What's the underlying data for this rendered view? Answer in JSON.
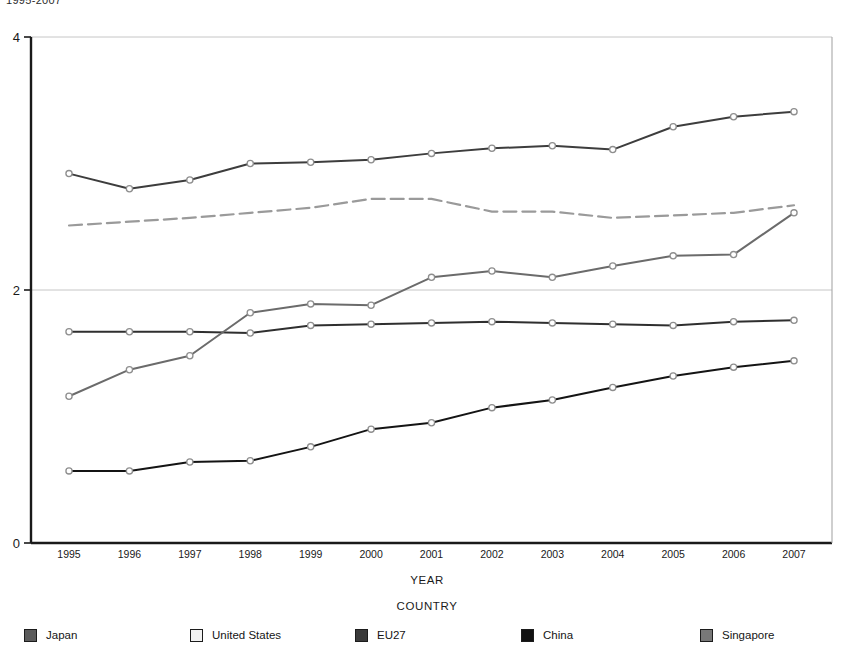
{
  "chart_title": "1995-2007",
  "axis_captions": {
    "x": "YEAR",
    "group": "COUNTRY"
  },
  "chart_data": {
    "type": "line",
    "title": "1995-2007",
    "xlabel": "YEAR",
    "ylabel": "",
    "legend_title": "COUNTRY",
    "legend_position": "bottom",
    "grid": true,
    "xlim": [
      1995,
      2007
    ],
    "ylim": [
      0,
      4
    ],
    "ytick_labels": [
      "0",
      "2",
      "4"
    ],
    "ytick_values": [
      0,
      2,
      4
    ],
    "categories": [
      "1995",
      "1996",
      "1997",
      "1998",
      "1999",
      "2000",
      "2001",
      "2002",
      "2003",
      "2004",
      "2005",
      "2006",
      "2007"
    ],
    "series": [
      {
        "name": "Japan",
        "color": "#3d3d3d",
        "style": "solid",
        "marker": "circle",
        "values": [
          2.92,
          2.8,
          2.87,
          3.0,
          3.01,
          3.03,
          3.08,
          3.12,
          3.14,
          3.11,
          3.29,
          3.37,
          3.41
        ]
      },
      {
        "name": "United States",
        "color": "#9a9a9a",
        "style": "dashed",
        "marker": "none",
        "values": [
          2.51,
          2.54,
          2.57,
          2.61,
          2.65,
          2.72,
          2.72,
          2.62,
          2.62,
          2.57,
          2.59,
          2.61,
          2.67
        ]
      },
      {
        "name": "EU27",
        "color": "#2f2f2f",
        "style": "solid",
        "marker": "circle",
        "values": [
          1.67,
          1.67,
          1.67,
          1.66,
          1.72,
          1.73,
          1.74,
          1.75,
          1.74,
          1.73,
          1.72,
          1.75,
          1.76
        ]
      },
      {
        "name": "China",
        "color": "#141414",
        "style": "solid",
        "marker": "circle",
        "values": [
          0.57,
          0.57,
          0.64,
          0.65,
          0.76,
          0.9,
          0.95,
          1.07,
          1.13,
          1.23,
          1.32,
          1.39,
          1.44
        ]
      },
      {
        "name": "Singapore",
        "color": "#6b6b6b",
        "style": "solid",
        "marker": "circle",
        "values": [
          1.16,
          1.37,
          1.48,
          1.82,
          1.89,
          1.88,
          2.1,
          2.15,
          2.1,
          2.19,
          2.27,
          2.28,
          2.61
        ]
      }
    ]
  },
  "legend": {
    "items": [
      {
        "label": "Japan",
        "swatch": "#5b5b5b",
        "x": 24
      },
      {
        "label": "United States",
        "swatch": "#f2f2f2",
        "x": 190
      },
      {
        "label": "EU27",
        "swatch": "#3a3a3a",
        "x": 355
      },
      {
        "label": "China",
        "swatch": "#111111",
        "x": 521
      },
      {
        "label": "Singapore",
        "swatch": "#787878",
        "x": 700
      }
    ]
  }
}
